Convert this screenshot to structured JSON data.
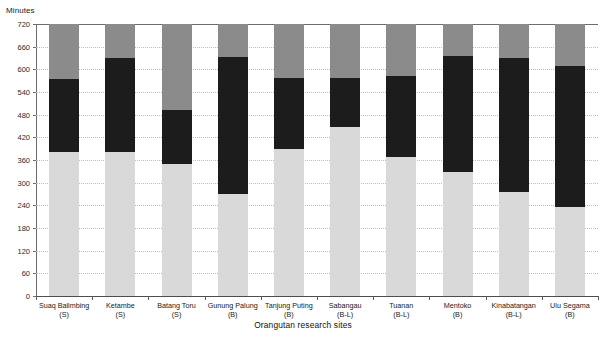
{
  "chart_data": {
    "type": "bar",
    "subtype": "stacked-bar-100pct-minutes",
    "title": "",
    "xlabel": "Orangutan research sites",
    "ylabel": "Minutes",
    "ylim": [
      0,
      720
    ],
    "yticks": [
      0,
      60,
      120,
      180,
      240,
      300,
      360,
      420,
      480,
      540,
      600,
      660,
      720
    ],
    "grid": true,
    "legend": false,
    "legend_position": "none",
    "categories": [
      "Suaq Balimbing",
      "Ketambe",
      "Batang Toru",
      "Gunung Palung",
      "Tanjung Puting",
      "Sabangau",
      "Tuanan",
      "Mentoko",
      "Kinabatangan",
      "Ulu Segama"
    ],
    "category_sublabels": [
      "(S)",
      "(S)",
      "(S)",
      "(B)",
      "(B)",
      "(B-L)",
      "(B-L)",
      "(B)",
      "(B-L)",
      "(B)"
    ],
    "series": [
      {
        "name": "bottom-segment",
        "color": "#d9d9d9",
        "values": [
          381,
          381,
          349,
          270,
          389,
          447,
          368,
          328,
          275,
          236
        ]
      },
      {
        "name": "middle-segment",
        "color": "#1c1c1c",
        "values": [
          193,
          249,
          143,
          363,
          188,
          130,
          214,
          307,
          355,
          373
        ]
      },
      {
        "name": "top-segment",
        "color": "#8b8b8b",
        "values": [
          146,
          90,
          228,
          87,
          143,
          143,
          138,
          85,
          90,
          111
        ]
      }
    ],
    "stack_tops": [
      {
        "bottom": 381,
        "bottom_plus_mid": 574,
        "total": 720
      },
      {
        "bottom": 381,
        "bottom_plus_mid": 630,
        "total": 720
      },
      {
        "bottom": 349,
        "bottom_plus_mid": 492,
        "total": 720
      },
      {
        "bottom": 270,
        "bottom_plus_mid": 633,
        "total": 720
      },
      {
        "bottom": 389,
        "bottom_plus_mid": 577,
        "total": 720
      },
      {
        "bottom": 447,
        "bottom_plus_mid": 577,
        "total": 720
      },
      {
        "bottom": 368,
        "bottom_plus_mid": 582,
        "total": 720
      },
      {
        "bottom": 328,
        "bottom_plus_mid": 635,
        "total": 720
      },
      {
        "bottom": 275,
        "bottom_plus_mid": 630,
        "total": 720
      },
      {
        "bottom": 236,
        "bottom_plus_mid": 609,
        "total": 720
      }
    ]
  },
  "axes": {
    "y_unit_title": "Minutes",
    "x_title": "Orangutan research sites",
    "y_tick_labels": [
      "720",
      "660",
      "600",
      "540",
      "480",
      "420",
      "360",
      "300",
      "240",
      "180",
      "120",
      "60",
      "0"
    ]
  },
  "colors": {
    "segment_top": "#8b8b8b",
    "segment_middle": "#1c1c1c",
    "segment_bottom": "#d9d9d9",
    "gridline": "#b9bfc9",
    "axis": "#6d6d6d",
    "text": "#1a1a1a",
    "background": "#ffffff"
  }
}
